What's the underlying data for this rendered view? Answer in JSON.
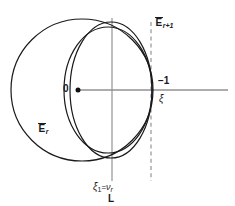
{
  "figure": {
    "title": "",
    "background_color": "#ffffff",
    "stroke_color": "#1a1a1a",
    "axis_color": "#555555",
    "line_color": "#777777"
  },
  "labels": {
    "ellipse_outer": {
      "text": "E",
      "subscript": "r",
      "overbar": true,
      "full": "Ē_r"
    },
    "ellipse_inner": {
      "text": "E",
      "subscript": "r+1",
      "overbar": true,
      "full": "Ē_{r+1}"
    },
    "origin": "0",
    "axis_mark": "−1",
    "axis_variable": "ξ",
    "vertical_line_label": "L",
    "abscissa_label_left": "ξ",
    "abscissa_label_left_sub": "1",
    "abscissa_label_eq": "=",
    "abscissa_label_right": "ν",
    "abscissa_label_right_sub": "r"
  },
  "geometry": {
    "circle_outer": {
      "cx": 82,
      "cy": 90,
      "r": 71
    },
    "ellipse_inner": {
      "cx": 112,
      "cy": 90,
      "rx": 41,
      "ry": 68
    },
    "ellipse_inner_secondary": {
      "cx": 110,
      "cy": 90,
      "rx": 43,
      "ry": 64
    },
    "vertical_line_solid_x": 112,
    "vertical_line_dashed_x": 151,
    "horizontal_axis_y": 90,
    "horizontal_axis_x_start": 78,
    "horizontal_axis_x_end": 228,
    "origin_dot": {
      "cx": 78,
      "cy": 90,
      "r": 2.4
    }
  }
}
